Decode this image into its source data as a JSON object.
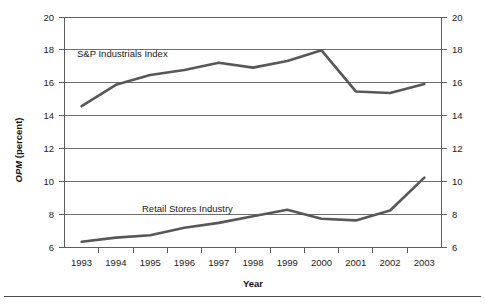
{
  "chart_data": {
    "type": "line",
    "title": "",
    "xlabel": "Year",
    "ylabel": "OPM (percent)",
    "ylabel_italic_part": "OPM",
    "ylabel_plain_part": " (percent)",
    "x": [
      1993,
      1994,
      1995,
      1996,
      1997,
      1998,
      1999,
      2000,
      2001,
      2002,
      2003
    ],
    "categories": [
      "1993",
      "1994",
      "1995",
      "1996",
      "1997",
      "1998",
      "1999",
      "2000",
      "2001",
      "2002",
      "2003"
    ],
    "ylim": [
      6,
      20
    ],
    "y_ticks": [
      6,
      8,
      10,
      12,
      14,
      16,
      18,
      20
    ],
    "y_tick_labels": [
      "6",
      "8",
      "10",
      "12",
      "14",
      "16",
      "18",
      "20"
    ],
    "right_axis": true,
    "right_y_tick_labels": [
      "6",
      "8",
      "10",
      "12",
      "14",
      "16",
      "18",
      "20"
    ],
    "grid": "horizontal",
    "legend_position": "inline-annotations",
    "series": [
      {
        "name": "S&P Industrials Index",
        "label_x_year": 1994,
        "values": [
          14.6,
          15.9,
          16.5,
          16.8,
          17.25,
          16.95,
          17.35,
          18.0,
          15.5,
          15.4,
          15.95
        ],
        "color": "#58585a"
      },
      {
        "name": "Retail Stores Industry",
        "label_x_year": 1997,
        "values": [
          6.35,
          6.6,
          6.75,
          7.2,
          7.5,
          7.9,
          8.3,
          7.75,
          7.65,
          8.25,
          10.25
        ],
        "color": "#58585a"
      }
    ],
    "annotations": [
      {
        "text": "S&P Industrials Index",
        "series": "S&P Industrials Index"
      },
      {
        "text": "Retail Stores Industry",
        "series": "Retail Stores Industry"
      }
    ]
  }
}
